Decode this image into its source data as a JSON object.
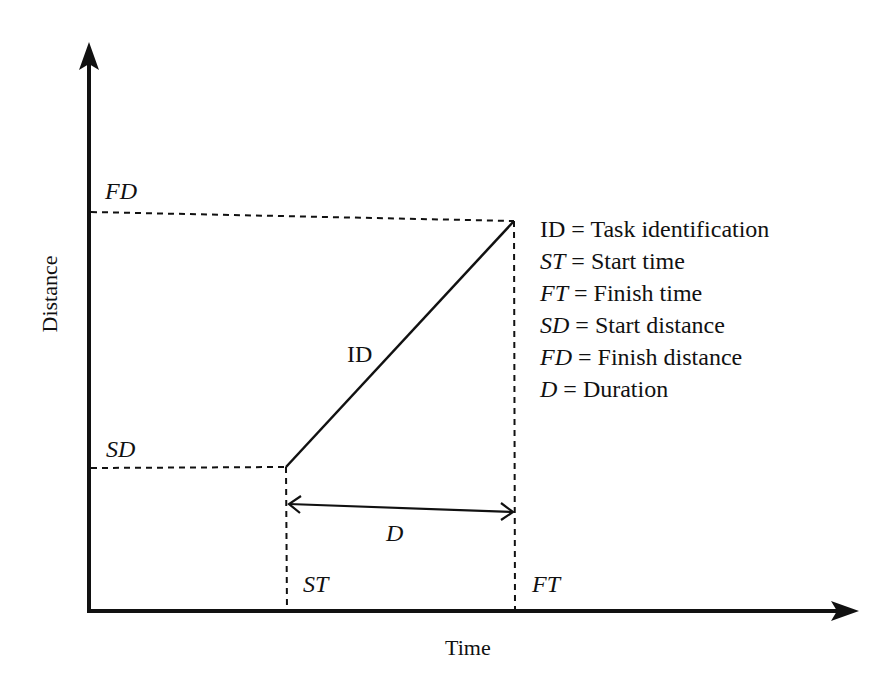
{
  "diagram": {
    "type": "time-distance chart (linear scheduling)",
    "axes": {
      "x_label": "Time",
      "y_label": "Distance"
    },
    "markers": {
      "start_distance": "SD",
      "finish_distance": "FD",
      "start_time": "ST",
      "finish_time": "FT",
      "duration": "D"
    },
    "task_line_label": "ID",
    "legend": [
      {
        "symbol": "ID",
        "italic": false,
        "text": " = Task identification"
      },
      {
        "symbol": "ST",
        "italic": true,
        "text": " = Start time"
      },
      {
        "symbol": "FT",
        "italic": true,
        "text": " = Finish time"
      },
      {
        "symbol": "SD",
        "italic": true,
        "text": " = Start distance"
      },
      {
        "symbol": "FD",
        "italic": true,
        "text": " = Finish distance"
      },
      {
        "symbol": "D",
        "italic": true,
        "text": " = Duration"
      }
    ],
    "colors": {
      "ink": "#111111",
      "background": "#ffffff"
    }
  }
}
